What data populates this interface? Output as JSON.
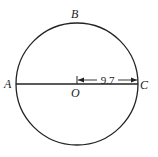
{
  "diagram": {
    "type": "circle-geometry",
    "circle": {
      "center_label": "O",
      "stroke_color": "#222222"
    },
    "points": {
      "A": {
        "label": "A"
      },
      "B": {
        "label": "B"
      },
      "C": {
        "label": "C"
      },
      "O": {
        "label": "O"
      }
    },
    "segments": [
      {
        "from": "A",
        "to": "C",
        "kind": "diameter"
      }
    ],
    "dimension": {
      "from": "O",
      "to": "C",
      "value": "9.7",
      "meaning": "radius"
    }
  }
}
